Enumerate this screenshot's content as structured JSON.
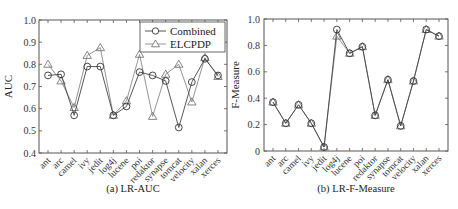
{
  "chart_data": [
    {
      "type": "line",
      "title": "",
      "caption": "(a) LR-AUC",
      "xlabel": "",
      "ylabel": "AUC",
      "ylim": [
        0.4,
        1.0
      ],
      "yticks": [
        0.4,
        0.5,
        0.6,
        0.7,
        0.8,
        0.9,
        1.0
      ],
      "ytick_labels": [
        "0.4",
        "0.5",
        "0.6",
        "0.7",
        "0.8",
        "0.9",
        "1.0"
      ],
      "categories": [
        "ant",
        "arc",
        "camel",
        "ivy",
        "jedit",
        "log4j",
        "lucene",
        "poi",
        "redaktor",
        "synapse",
        "tomcat",
        "velocity",
        "xalan",
        "xerces"
      ],
      "legend_position": "top-right",
      "series": [
        {
          "name": "Combined",
          "marker": "circle",
          "values": [
            0.75,
            0.755,
            0.57,
            0.79,
            0.79,
            0.57,
            0.61,
            0.765,
            0.75,
            0.725,
            0.515,
            0.72,
            0.825,
            0.75
          ]
        },
        {
          "name": "ELCPDP",
          "marker": "triangle",
          "values": [
            0.8,
            0.725,
            0.605,
            0.84,
            0.875,
            0.57,
            0.635,
            0.845,
            0.565,
            0.755,
            0.8,
            0.63,
            0.83,
            0.745
          ]
        }
      ]
    },
    {
      "type": "line",
      "title": "",
      "caption": "(b) LR-F-Measure",
      "xlabel": "",
      "ylabel": "F-Measure",
      "ylim": [
        0,
        1.0
      ],
      "yticks": [
        0,
        0.2,
        0.4,
        0.6,
        0.8,
        1.0
      ],
      "ytick_labels": [
        "0",
        "0.2",
        "0.4",
        "0.6",
        "0.8",
        "1.0"
      ],
      "categories": [
        "ant",
        "arc",
        "camel",
        "ivy",
        "jedit",
        "log4j",
        "lucene",
        "poi",
        "redaktor",
        "synapse",
        "tomcat",
        "velocity",
        "xalan",
        "xerces"
      ],
      "legend_position": "none",
      "series": [
        {
          "name": "Combined",
          "marker": "circle",
          "values": [
            0.37,
            0.21,
            0.35,
            0.21,
            0.03,
            0.92,
            0.74,
            0.79,
            0.27,
            0.54,
            0.19,
            0.53,
            0.92,
            0.87
          ]
        },
        {
          "name": "ELCPDP",
          "marker": "triangle",
          "values": [
            0.37,
            0.21,
            0.35,
            0.21,
            0.03,
            0.87,
            0.74,
            0.79,
            0.27,
            0.54,
            0.19,
            0.53,
            0.92,
            0.87
          ]
        }
      ]
    }
  ]
}
